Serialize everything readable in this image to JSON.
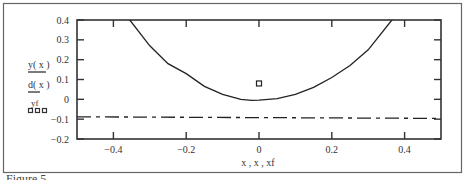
{
  "caption": "Figure 5",
  "chart_data": {
    "type": "line",
    "title": "",
    "xlabel": "x , x , xf",
    "ylabel": "",
    "xlim": [
      -0.5,
      0.5
    ],
    "ylim": [
      -0.2,
      0.4
    ],
    "grid": false,
    "legend_position": "left",
    "x_ticks": [
      -0.4,
      -0.2,
      0,
      0.2,
      0.4
    ],
    "x_tick_labels": [
      "−0.4",
      "−0.2",
      "0",
      "0.2",
      "0.4"
    ],
    "y_ticks": [
      0.4,
      0.3,
      0.2,
      0.1,
      0,
      -0.1,
      -0.2
    ],
    "y_tick_labels": [
      "0.4",
      "0.3",
      "0.2",
      "0.1",
      "0",
      "−0.1",
      "−0.2"
    ],
    "legend": [
      {
        "label": "y( x )",
        "style": "solid"
      },
      {
        "label": "d( x )",
        "style": "dash-dot"
      },
      {
        "label": "yf",
        "style": "squares"
      }
    ],
    "series": [
      {
        "name": "y( x )",
        "style": "solid",
        "x": [
          -0.5,
          -0.45,
          -0.4,
          -0.355,
          -0.3,
          -0.25,
          -0.2,
          -0.15,
          -0.1,
          -0.05,
          -0.02,
          0,
          0.05,
          0.1,
          0.15,
          0.2,
          0.25,
          0.3,
          0.365,
          0.4,
          0.45,
          0.5
        ],
        "values": [
          0.75,
          0.61,
          0.48,
          0.4,
          0.27,
          0.18,
          0.13,
          0.065,
          0.025,
          0.0,
          -0.005,
          -0.004,
          0.003,
          0.025,
          0.06,
          0.11,
          0.17,
          0.25,
          0.4,
          0.48,
          0.62,
          0.76
        ]
      },
      {
        "name": "d( x )",
        "style": "dash-dot",
        "x": [
          -0.5,
          0.5
        ],
        "values": [
          -0.088,
          -0.096
        ]
      },
      {
        "name": "yf",
        "style": "squares",
        "x": [
          0
        ],
        "values": [
          0.08
        ]
      }
    ]
  }
}
